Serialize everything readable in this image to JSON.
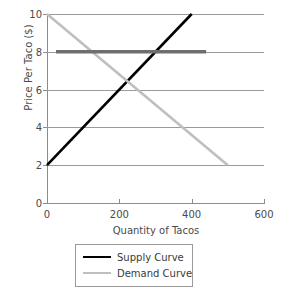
{
  "chart_data": {
    "type": "line",
    "title": "",
    "xlabel": "Quantity of Tacos",
    "ylabel": "Price Per Taco ($)",
    "xlim": [
      0,
      600
    ],
    "ylim": [
      0,
      10
    ],
    "xticks": [
      0,
      200,
      400,
      600
    ],
    "xtick_labels": [
      "0",
      "200",
      "400",
      "600"
    ],
    "yticks": [
      0,
      2,
      4,
      6,
      8,
      10
    ],
    "ytick_labels": [
      "0",
      "2",
      "4",
      "6",
      "8",
      "10"
    ],
    "grid": "horizontal",
    "grid_color": "#9a9a9a",
    "legend_position": "bottom-center",
    "equilibrium": {
      "quantity": 250,
      "price": 6
    },
    "series": [
      {
        "name": "Supply Curve",
        "color": "#000000",
        "width": 2.6,
        "points": [
          [
            0,
            2
          ],
          [
            400,
            10
          ]
        ]
      },
      {
        "name": "Demand Curve",
        "color": "#bfbfbf",
        "width": 2.6,
        "points": [
          [
            0,
            10
          ],
          [
            500,
            2
          ]
        ]
      },
      {
        "name": "Price Ceiling Line",
        "color": "#6e6e6e",
        "width": 3.4,
        "points": [
          [
            25,
            8
          ],
          [
            440,
            8
          ]
        ]
      }
    ]
  },
  "axes": {
    "y_title": "Price Per Taco ($)",
    "x_title": "Quantity of Tacos"
  },
  "legend": {
    "entries": [
      {
        "label": "Supply Curve",
        "color": "#000000",
        "width": "2.6px"
      },
      {
        "label": "Demand Curve",
        "color": "#bfbfbf",
        "width": "2.6px"
      }
    ]
  }
}
